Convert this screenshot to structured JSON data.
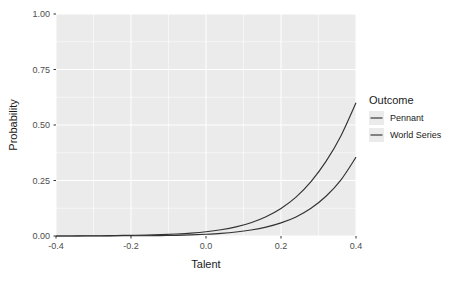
{
  "chart_data": {
    "type": "line",
    "title": "",
    "xlabel": "Talent",
    "ylabel": "Probability",
    "xlim": [
      -0.4,
      0.4
    ],
    "ylim": [
      0.0,
      1.0
    ],
    "xticks": [
      "-0.4",
      "-0.2",
      "0.0",
      "0.2",
      "0.4"
    ],
    "xtick_values": [
      -0.4,
      -0.2,
      0.0,
      0.2,
      0.4
    ],
    "yticks": [
      "0.00",
      "0.25",
      "0.50",
      "0.75",
      "1.00"
    ],
    "ytick_values": [
      0.0,
      0.25,
      0.5,
      0.75,
      1.0
    ],
    "grid": true,
    "grid_color": "#ffffff",
    "panel_color": "#ebebeb",
    "legend_position": "right",
    "legend_title": "Outcome",
    "x": [
      -0.4,
      -0.36,
      -0.32,
      -0.28,
      -0.24,
      -0.2,
      -0.16,
      -0.12,
      -0.08,
      -0.04,
      0.0,
      0.04,
      0.08,
      0.12,
      0.16,
      0.2,
      0.24,
      0.28,
      0.32,
      0.36,
      0.4
    ],
    "series": [
      {
        "name": "Pennant",
        "color": "#333333",
        "values": [
          0.0,
          0.0,
          0.001,
          0.001,
          0.002,
          0.003,
          0.004,
          0.006,
          0.009,
          0.013,
          0.019,
          0.028,
          0.041,
          0.06,
          0.087,
          0.124,
          0.175,
          0.245,
          0.336,
          0.452,
          0.6
        ]
      },
      {
        "name": "World Series",
        "color": "#333333",
        "values": [
          0.0,
          0.0,
          0.0,
          0.0,
          0.001,
          0.001,
          0.001,
          0.002,
          0.003,
          0.005,
          0.008,
          0.012,
          0.018,
          0.027,
          0.04,
          0.059,
          0.086,
          0.125,
          0.179,
          0.253,
          0.355
        ]
      }
    ]
  },
  "axes": {
    "x_title": "Talent",
    "y_title": "Probability"
  },
  "legend": {
    "title": "Outcome",
    "items": [
      {
        "label": "Pennant"
      },
      {
        "label": "World Series"
      }
    ]
  }
}
